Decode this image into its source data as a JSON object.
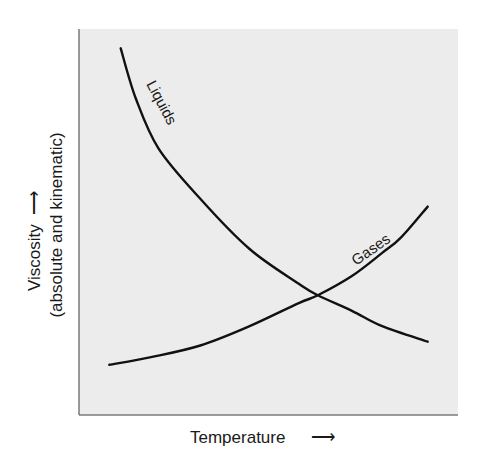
{
  "chart_data": {
    "type": "line",
    "title": "",
    "xlabel": "Temperature",
    "ylabel": "Viscosity",
    "ylabel_sub": "(absolute and kinematic)",
    "x_arrow": "⟶",
    "y_arrow": "⟶",
    "grid": false,
    "legend": "none (curves labeled inline)",
    "xlim": [
      0,
      1
    ],
    "ylim": [
      0,
      1
    ],
    "series": [
      {
        "name": "Liquids",
        "label": "Liquids",
        "trend": "decreasing",
        "x": [
          0.11,
          0.15,
          0.21,
          0.32,
          0.45,
          0.58,
          0.63,
          0.72,
          0.8,
          0.92
        ],
        "y": [
          0.95,
          0.82,
          0.69,
          0.56,
          0.43,
          0.34,
          0.31,
          0.27,
          0.23,
          0.19
        ]
      },
      {
        "name": "Gases",
        "label": "Gases",
        "trend": "increasing",
        "x": [
          0.08,
          0.19,
          0.32,
          0.45,
          0.58,
          0.63,
          0.72,
          0.8,
          0.85,
          0.92
        ],
        "y": [
          0.13,
          0.15,
          0.18,
          0.23,
          0.29,
          0.31,
          0.36,
          0.42,
          0.46,
          0.54
        ]
      }
    ],
    "annotations": [
      {
        "text": "Liquids",
        "near_series": "Liquids",
        "rotation_deg": 62
      },
      {
        "text": "Gases",
        "near_series": "Gases",
        "rotation_deg": -35
      }
    ],
    "intersection": {
      "x": 0.63,
      "y": 0.31
    }
  },
  "colors": {
    "plot_background": "#ececec",
    "axis": "#7a7a7a",
    "curve": "#111111",
    "text": "#1a1a1a"
  }
}
